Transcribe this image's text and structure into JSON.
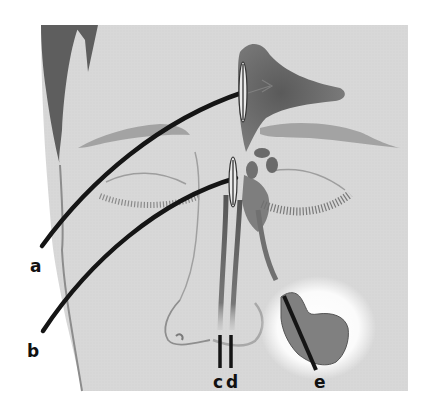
{
  "diagram": {
    "labels": [
      {
        "id": "a",
        "text": "a",
        "x": 30,
        "y": 272
      },
      {
        "id": "b",
        "text": "b",
        "x": 27,
        "y": 357
      },
      {
        "id": "c",
        "text": "c",
        "x": 217,
        "y": 388
      },
      {
        "id": "d",
        "text": "d",
        "x": 229,
        "y": 388
      },
      {
        "id": "e",
        "text": "e",
        "x": 318,
        "y": 388
      }
    ],
    "colors": {
      "background": "#ffffff",
      "skin": "#d9d9d9",
      "hair": "#5a5a5a",
      "sinus": "#6a6a6a",
      "maxillary_fill": "#808080",
      "instrument": "#151515",
      "outline": "#8a8a8a"
    }
  }
}
